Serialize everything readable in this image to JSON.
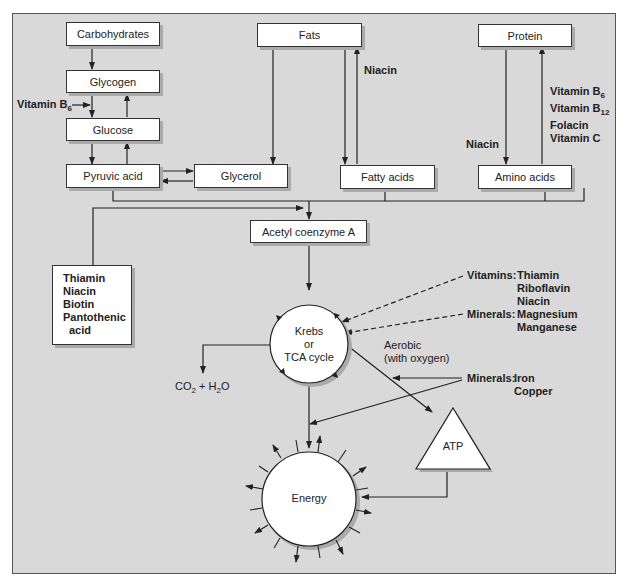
{
  "nodes": {
    "carbohydrates": "Carbohydrates",
    "glycogen": "Glycogen",
    "glucose": "Glucose",
    "pyruvic_acid": "Pyruvic acid",
    "glycerol": "Glycerol",
    "fats": "Fats",
    "fatty_acids": "Fatty acids",
    "protein": "Protein",
    "amino_acids": "Amino acids",
    "acetyl_coa": "Acetyl coenzyme A",
    "krebs": [
      "Krebs",
      "or",
      "TCA cycle"
    ],
    "energy": "Energy",
    "atp": "ATP",
    "co2_h2o": {
      "co": "CO",
      "sub1": "2",
      "plus_h": " + H",
      "sub2": "2",
      "o": "O"
    }
  },
  "labels": {
    "vitamin_b6_left": {
      "text": "Vitamin B",
      "sub": "6"
    },
    "niacin_fats": "Niacin",
    "niacin_protein": "Niacin",
    "protein_vitamins": [
      {
        "text": "Vitamin B",
        "sub": "6"
      },
      {
        "text": "Vitamin B",
        "sub": "12"
      },
      {
        "text": "Folacin",
        "sub": ""
      },
      {
        "text": "Vitamin C",
        "sub": ""
      }
    ],
    "cofactors_box": [
      "Thiamin",
      "Niacin",
      "Biotin",
      "Pantothenic",
      "  acid"
    ],
    "krebs_vitamins_head": "Vitamins:",
    "krebs_vitamins": [
      "Thiamin",
      "Riboflavin",
      "Niacin"
    ],
    "krebs_minerals_head": "Minerals:",
    "krebs_minerals": [
      "Magnesium",
      "Manganese"
    ],
    "aerobic": [
      "Aerobic",
      "(with oxygen)"
    ],
    "atp_minerals_head": "Minerals:",
    "atp_minerals": [
      "Iron",
      "Copper"
    ]
  },
  "colors": {
    "panel": "#d9d9d9",
    "box": "#ffffff",
    "line": "#222222",
    "shadow": "#aaaaaa"
  }
}
